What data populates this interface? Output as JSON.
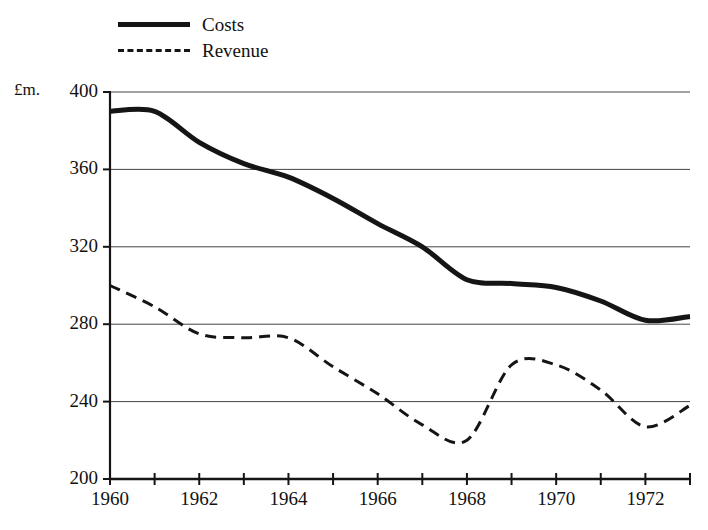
{
  "chart_data": {
    "type": "line",
    "title": "",
    "xlabel": "",
    "ylabel": "£m.",
    "y_unit_label": "£m.",
    "xlim": [
      1960,
      1973
    ],
    "ylim": [
      200,
      400
    ],
    "grid": true,
    "grid_axis": "y",
    "legend_position": "top-left",
    "x": [
      1960,
      1961,
      1962,
      1963,
      1964,
      1965,
      1966,
      1967,
      1968,
      1969,
      1970,
      1971,
      1972,
      1973
    ],
    "y_ticks": [
      200,
      240,
      280,
      320,
      360,
      400
    ],
    "y_tick_labels": [
      "200",
      "240",
      "280",
      "320",
      "360",
      "400"
    ],
    "x_ticks": [
      1960,
      1961,
      1962,
      1963,
      1964,
      1965,
      1966,
      1967,
      1968,
      1969,
      1970,
      1971,
      1972,
      1973
    ],
    "x_tick_labels_shown": [
      "1960",
      "1962",
      "1964",
      "1966",
      "1968",
      "1970",
      "1972"
    ],
    "x_labeled_values": [
      1960,
      1962,
      1964,
      1966,
      1968,
      1970,
      1972
    ],
    "series": [
      {
        "name": "Costs",
        "style": "solid",
        "line_width": 5,
        "color": "#151515",
        "values": [
          390,
          390,
          374,
          363,
          356,
          345,
          332,
          320,
          303,
          301,
          299,
          292,
          282,
          284
        ]
      },
      {
        "name": "Revenue",
        "style": "dashed",
        "line_width": 3,
        "color": "#151515",
        "values": [
          300,
          289,
          275,
          273,
          273,
          258,
          244,
          228,
          220,
          259,
          259,
          246,
          227,
          238
        ]
      }
    ]
  },
  "legend": {
    "items": [
      {
        "label": "Costs",
        "style": "solid"
      },
      {
        "label": "Revenue",
        "style": "dashed"
      }
    ]
  },
  "axes": {
    "y_unit": "£m.",
    "y_labels": [
      "400",
      "360",
      "320",
      "280",
      "240",
      "200"
    ],
    "x_labels": [
      "1960",
      "1962",
      "1964",
      "1966",
      "1968",
      "1970",
      "1972"
    ]
  }
}
